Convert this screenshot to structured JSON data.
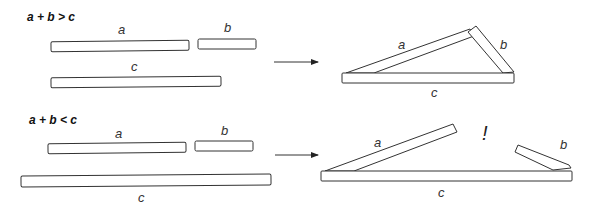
{
  "diagram": {
    "panels": [
      {
        "condition": "a + b > c",
        "sticks": {
          "a": "a",
          "b": "b",
          "c": "c"
        },
        "result_labels": {
          "a": "a",
          "b": "b",
          "c": "c"
        },
        "outcome": "triangle forms"
      },
      {
        "condition": "a + b < c",
        "sticks": {
          "a": "a",
          "b": "b",
          "c": "c"
        },
        "result_labels": {
          "a": "a",
          "b": "b",
          "c": "c"
        },
        "exclamation": "!",
        "outcome": "sticks do not meet"
      }
    ],
    "colors": {
      "stroke": "#333333",
      "fill": "#ffffff",
      "text": "#111111"
    }
  }
}
